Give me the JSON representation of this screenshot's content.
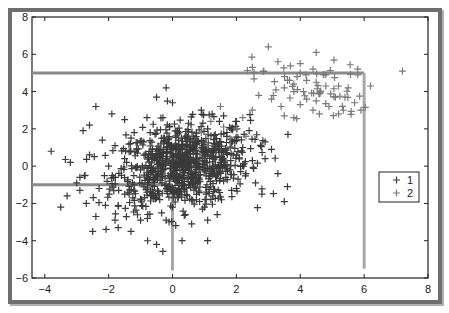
{
  "chart_data": {
    "type": "scatter",
    "title": "",
    "xlabel": "",
    "ylabel": "",
    "xlim": [
      -4.4,
      8
    ],
    "ylim": [
      -6,
      8
    ],
    "xticks": [
      -4,
      -2,
      0,
      2,
      4,
      6,
      8
    ],
    "yticks": [
      -6,
      -4,
      -2,
      0,
      2,
      4,
      6,
      8
    ],
    "xtick_labels": [
      "−4",
      "−2",
      "0",
      "2",
      "4",
      "6",
      "8"
    ],
    "ytick_labels": [
      "−6",
      "−4",
      "−2",
      "0",
      "2",
      "4",
      "6",
      "8"
    ],
    "grid": false,
    "legend_position": "right-center",
    "marker": "+",
    "series": [
      {
        "name": "1",
        "color": "#3a3a3a",
        "description": "dense cluster centered near (0.3, 0), roughly x in [-4, 3.5], y in [-4.2, 4.2]",
        "center": [
          0.3,
          0.0
        ],
        "spread": [
          1.05,
          1.1
        ],
        "count_approx": 900,
        "points": [
          [
            -3.8,
            0.8
          ],
          [
            -3.3,
            -1.6
          ],
          [
            -3.5,
            -2.2
          ],
          [
            -2.7,
            -2.0
          ],
          [
            -2.4,
            -2.7
          ],
          [
            -2.5,
            -3.5
          ],
          [
            -1.7,
            -3.3
          ],
          [
            -1.3,
            -3.5
          ],
          [
            -0.5,
            -4.2
          ],
          [
            -2.9,
            -0.6
          ],
          [
            -2.6,
            2.2
          ],
          [
            -2.4,
            3.2
          ],
          [
            -1.9,
            2.8
          ],
          [
            -2.8,
            1.9
          ],
          [
            -3.0,
            -0.9
          ],
          [
            -2.1,
            -2.1
          ],
          [
            -1.8,
            -2.9
          ],
          [
            -1.0,
            -2.9
          ],
          [
            0.3,
            -4.0
          ],
          [
            1.1,
            -4.0
          ],
          [
            1.1,
            -2.9
          ],
          [
            -0.8,
            2.6
          ],
          [
            -0.2,
            4.2
          ],
          [
            -0.5,
            3.7
          ],
          [
            0.0,
            3.4
          ],
          [
            1.6,
            2.7
          ],
          [
            0.9,
            3.0
          ],
          [
            2.4,
            1.9
          ],
          [
            2.9,
            0.4
          ],
          [
            3.3,
            -0.4
          ],
          [
            3.6,
            -1.1
          ],
          [
            3.5,
            -1.9
          ],
          [
            2.8,
            -1.5
          ],
          [
            -1.2,
            1.8
          ],
          [
            -0.9,
            1.3
          ],
          [
            -0.4,
            0.9
          ],
          [
            0.0,
            0.5
          ],
          [
            0.4,
            0.2
          ],
          [
            0.8,
            -0.1
          ],
          [
            1.2,
            -0.4
          ],
          [
            1.6,
            -0.8
          ],
          [
            2.0,
            -1.2
          ],
          [
            -1.5,
            0.4
          ],
          [
            -1.0,
            -0.2
          ],
          [
            -0.6,
            -0.6
          ],
          [
            -0.2,
            -1.0
          ],
          [
            0.2,
            -1.4
          ],
          [
            0.6,
            -1.8
          ],
          [
            1.0,
            -2.2
          ],
          [
            1.4,
            -2.6
          ],
          [
            -2.0,
            0.0
          ],
          [
            -1.6,
            -0.5
          ],
          [
            -1.2,
            -1.0
          ],
          [
            -0.8,
            -1.4
          ],
          [
            -0.4,
            -1.8
          ],
          [
            0.0,
            -2.2
          ],
          [
            0.4,
            -2.6
          ],
          [
            -1.8,
            1.1
          ],
          [
            -1.3,
            1.5
          ],
          [
            -0.7,
            1.8
          ],
          [
            -0.1,
            2.1
          ],
          [
            0.5,
            2.3
          ],
          [
            1.1,
            2.0
          ],
          [
            1.7,
            1.6
          ],
          [
            2.2,
            1.0
          ],
          [
            2.5,
            0.3
          ],
          [
            2.3,
            -0.4
          ],
          [
            1.9,
            0.6
          ],
          [
            1.3,
            1.2
          ],
          [
            0.7,
            1.5
          ],
          [
            0.1,
            1.2
          ],
          [
            -0.5,
            0.3
          ],
          [
            -1.1,
            0.7
          ],
          [
            0.9,
            0.8
          ],
          [
            1.5,
            0.2
          ],
          [
            -0.3,
            -0.2
          ],
          [
            0.5,
            -0.6
          ],
          [
            1.0,
            0.3
          ],
          [
            -0.7,
            0.0
          ],
          [
            0.2,
            0.9
          ],
          [
            1.8,
            -0.2
          ],
          [
            -1.4,
            -1.4
          ],
          [
            -2.3,
            -1.2
          ],
          [
            -2.6,
            0.6
          ],
          [
            -2.2,
            1.4
          ],
          [
            0.6,
            -3.1
          ],
          [
            -0.2,
            -2.9
          ],
          [
            2.6,
            -0.9
          ],
          [
            2.9,
            1.3
          ],
          [
            3.1,
            0.9
          ],
          [
            2.0,
            2.4
          ],
          [
            -0.3,
            2.6
          ],
          [
            -1.5,
            2.5
          ],
          [
            -3.2,
            0.2
          ],
          [
            -2.9,
            -1.3
          ]
        ]
      },
      {
        "name": "2",
        "color": "#7a7a7a",
        "description": "sparser cluster centered near (4.3, 4.2), roughly x in [1.5, 7.3], y in [1.5, 6.5]",
        "center": [
          4.3,
          4.2
        ],
        "spread": [
          0.9,
          0.8
        ],
        "count_approx": 100,
        "points": [
          [
            3.0,
            6.4
          ],
          [
            4.5,
            6.1
          ],
          [
            3.3,
            5.6
          ],
          [
            2.5,
            5.3
          ],
          [
            4.0,
            5.5
          ],
          [
            4.4,
            5.2
          ],
          [
            5.8,
            5.2
          ],
          [
            7.2,
            5.1
          ],
          [
            4.0,
            5.0
          ],
          [
            3.9,
            4.8
          ],
          [
            4.2,
            4.6
          ],
          [
            3.6,
            4.6
          ],
          [
            3.8,
            4.4
          ],
          [
            4.5,
            4.5
          ],
          [
            4.8,
            4.3
          ],
          [
            5.2,
            4.3
          ],
          [
            5.5,
            4.2
          ],
          [
            6.2,
            4.3
          ],
          [
            3.5,
            4.2
          ],
          [
            3.8,
            4.0
          ],
          [
            4.1,
            4.0
          ],
          [
            4.6,
            3.9
          ],
          [
            5.4,
            3.7
          ],
          [
            2.7,
            3.8
          ],
          [
            3.1,
            3.6
          ],
          [
            3.4,
            3.2
          ],
          [
            4.0,
            3.3
          ],
          [
            4.2,
            3.6
          ],
          [
            4.5,
            3.5
          ],
          [
            4.9,
            3.2
          ],
          [
            5.1,
            3.7
          ],
          [
            5.7,
            3.4
          ],
          [
            5.9,
            3.0
          ],
          [
            5.2,
            2.8
          ],
          [
            3.5,
            2.7
          ],
          [
            2.2,
            2.6
          ],
          [
            2.0,
            2.0
          ],
          [
            1.2,
            2.4
          ],
          [
            0.9,
            1.8
          ],
          [
            1.8,
            1.5
          ],
          [
            2.5,
            3.0
          ],
          [
            3.8,
            2.6
          ],
          [
            4.6,
            2.8
          ],
          [
            4.4,
            3.0
          ],
          [
            5.8,
            4.9
          ],
          [
            1.5,
            3.2
          ],
          [
            2.3,
            1.6
          ],
          [
            1.1,
            1.1
          ],
          [
            1.6,
            2.1
          ],
          [
            4.8,
            4.9
          ]
        ]
      }
    ],
    "annotations": {
      "lines": [
        {
          "from": [
            -4.4,
            -1.0
          ],
          "to": [
            0.0,
            -1.0
          ],
          "color": "#8a8a8a"
        },
        {
          "from": [
            0.0,
            -1.0
          ],
          "to": [
            0.0,
            -5.6
          ],
          "color": "#a8a8a8"
        },
        {
          "from": [
            -4.4,
            5.0
          ],
          "to": [
            6.0,
            5.0
          ],
          "color": "#8a8a8a"
        },
        {
          "from": [
            6.0,
            5.0
          ],
          "to": [
            6.0,
            -5.5
          ],
          "color": "#a8a8a8"
        }
      ]
    }
  },
  "legend": {
    "entries": [
      {
        "label": "1",
        "color": "#3a3a3a"
      },
      {
        "label": "2",
        "color": "#7a7a7a"
      }
    ]
  }
}
